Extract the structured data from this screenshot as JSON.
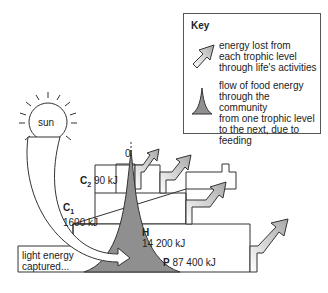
{
  "key": {
    "title": "Key",
    "items": [
      {
        "icon": "arrow-icon",
        "text": [
          "energy lost from",
          "each trophic level",
          "through life's activities"
        ]
      },
      {
        "icon": "spike-icon",
        "text": [
          "flow of food energy",
          "through the community",
          "from one trophic level",
          "to the next, due to",
          "feeding"
        ]
      }
    ]
  },
  "sun": {
    "label": "sun"
  },
  "levels": [
    {
      "code": "P",
      "value": "87400 kJ",
      "display_value": "87 400 kJ"
    },
    {
      "code": "H",
      "value": "14200 kJ",
      "display_value": "14 200 kJ"
    },
    {
      "code": "C",
      "sub": "1",
      "value": "1600 kJ",
      "display_value": "1600 kJ"
    },
    {
      "code": "C",
      "sub": "2",
      "value": "90 kJ",
      "display_value": "90 kJ"
    }
  ],
  "top_label": "0",
  "light_energy": [
    "light energy",
    "captured..."
  ],
  "colors": {
    "flow": "#8f8f8f",
    "arrow_start": "#ffffff",
    "arrow_end": "#a8a8a8",
    "line": "#333333"
  }
}
